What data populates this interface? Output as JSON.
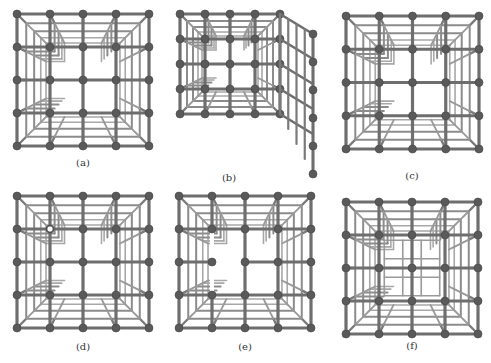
{
  "figure": {
    "panels": [
      {
        "id": "a",
        "label": "(a)",
        "variant": "complete"
      },
      {
        "id": "b",
        "label": "(b)",
        "variant": "right-face-opened"
      },
      {
        "id": "c",
        "label": "(c)",
        "variant": "complete"
      },
      {
        "id": "d",
        "label": "(d)",
        "variant": "defect-node"
      },
      {
        "id": "e",
        "label": "(e)",
        "variant": "removed-front-bonds"
      },
      {
        "id": "f",
        "label": "(f)",
        "variant": "inner-lattice"
      }
    ],
    "colors": {
      "bond": "#6e6e6e",
      "node": "#5a5a5a",
      "inner": "#9a9a9a",
      "background": "#ffffff"
    }
  }
}
